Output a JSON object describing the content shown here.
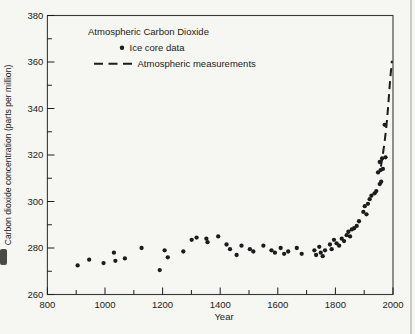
{
  "figure": {
    "background": "#f6f6f2",
    "ink": "#1c1c1c",
    "frame_color": "#3a3a38"
  },
  "chart_data": {
    "type": "scatter",
    "title": "Atmospheric Carbon Dioxide",
    "xlabel": "Year",
    "ylabel": "Carbon dioxide concentration (parts per million)",
    "xlim": [
      800,
      2000
    ],
    "ylim": [
      260,
      380
    ],
    "grid": false,
    "frame": "full-box",
    "x_major_ticks": [
      800,
      1000,
      1200,
      1400,
      1600,
      1800,
      2000
    ],
    "x_minor_ticks": [
      900,
      1100,
      1300,
      1500,
      1700,
      1900
    ],
    "y_major_ticks": [
      260,
      280,
      300,
      320,
      340,
      360,
      380
    ],
    "y_minor_ticks": [
      270,
      290,
      310,
      330,
      350,
      370
    ],
    "legend": {
      "position": "top-left-inside",
      "entries": [
        {
          "label": "Ice core data",
          "marker": "dot"
        },
        {
          "label": "Atmospheric measurements",
          "marker": "dashed-line"
        }
      ]
    },
    "series": [
      {
        "name": "Ice core data",
        "type": "scatter",
        "marker": "filled-circle",
        "color": "#1c1c1c",
        "points": [
          [
            905,
            272.5
          ],
          [
            945,
            275
          ],
          [
            995,
            273.5
          ],
          [
            1031,
            278
          ],
          [
            1036,
            274.5
          ],
          [
            1069,
            275.5
          ],
          [
            1127,
            280
          ],
          [
            1190,
            270.5
          ],
          [
            1207,
            279
          ],
          [
            1218,
            276
          ],
          [
            1272,
            278.5
          ],
          [
            1301,
            283.5
          ],
          [
            1318,
            284.5
          ],
          [
            1352,
            284
          ],
          [
            1356,
            282.5
          ],
          [
            1393,
            285
          ],
          [
            1422,
            281.5
          ],
          [
            1434,
            279.5
          ],
          [
            1457,
            277
          ],
          [
            1474,
            281
          ],
          [
            1503,
            279.5
          ],
          [
            1515,
            278.5
          ],
          [
            1550,
            281
          ],
          [
            1578,
            279
          ],
          [
            1590,
            278
          ],
          [
            1610,
            280
          ],
          [
            1622,
            277.5
          ],
          [
            1636,
            278.5
          ],
          [
            1666,
            280
          ],
          [
            1683,
            277.5
          ],
          [
            1727,
            279
          ],
          [
            1733,
            277
          ],
          [
            1744,
            280.5
          ],
          [
            1749,
            278
          ],
          [
            1756,
            276.5
          ],
          [
            1764,
            279
          ],
          [
            1781,
            281.5
          ],
          [
            1787,
            279.5
          ],
          [
            1795,
            283.5
          ],
          [
            1804,
            282
          ],
          [
            1813,
            281
          ],
          [
            1822,
            284
          ],
          [
            1830,
            283
          ],
          [
            1839,
            285.5
          ],
          [
            1845,
            287
          ],
          [
            1851,
            285
          ],
          [
            1857,
            288
          ],
          [
            1865,
            288.5
          ],
          [
            1874,
            289.5
          ],
          [
            1882,
            291.5
          ],
          [
            1897,
            295.5
          ],
          [
            1902,
            298
          ],
          [
            1908,
            294.5
          ],
          [
            1913,
            299
          ],
          [
            1919,
            301
          ],
          [
            1925,
            302.5
          ],
          [
            1936,
            303.5
          ],
          [
            1942,
            304.5
          ],
          [
            1948,
            312.5
          ],
          [
            1954,
            307.5
          ],
          [
            1954,
            317
          ],
          [
            1957,
            313.5
          ],
          [
            1959,
            308.5
          ],
          [
            1962,
            318.5
          ],
          [
            1965,
            314
          ],
          [
            1971,
            333
          ],
          [
            1974,
            319
          ]
        ]
      },
      {
        "name": "Atmospheric measurements",
        "type": "line",
        "style": "dashed",
        "color": "#1c1c1c",
        "points": [
          [
            1958,
            315
          ],
          [
            1964,
            319.5
          ],
          [
            1970,
            325
          ],
          [
            1976,
            331
          ],
          [
            1981,
            337.5
          ],
          [
            1985,
            344
          ],
          [
            1989,
            350.5
          ],
          [
            1992,
            355
          ],
          [
            1995,
            358.5
          ],
          [
            1996,
            360.5
          ]
        ]
      }
    ]
  }
}
